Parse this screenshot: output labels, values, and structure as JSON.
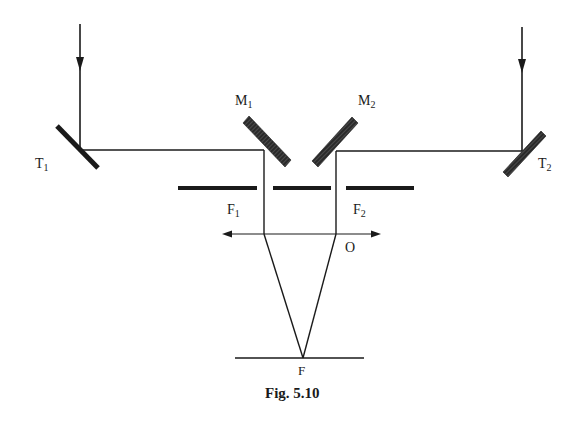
{
  "figure": {
    "caption": "Fig. 5.10",
    "type": "optical schematic (stellar interferometer)"
  },
  "labels": {
    "T1": {
      "main": "T",
      "sub": "1"
    },
    "T2": {
      "main": "T",
      "sub": "2"
    },
    "M1": {
      "main": "M",
      "sub": "1"
    },
    "M2": {
      "main": "M",
      "sub": "2"
    },
    "F1": {
      "main": "F",
      "sub": "1"
    },
    "F2": {
      "main": "F",
      "sub": "2"
    },
    "O": "O",
    "F": "F"
  },
  "colors": {
    "ink": "#1a1a1a",
    "background": "#ffffff"
  }
}
